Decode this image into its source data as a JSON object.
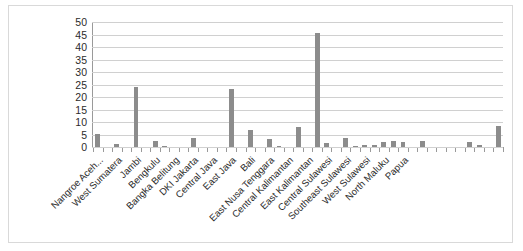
{
  "chart": {
    "title": "",
    "border_color": "#d9d9d9",
    "bar_color": "#8c8c8c",
    "gridline_color": "#d0d0d0",
    "axis_color": "#9a9a9a"
  },
  "chart_data": {
    "type": "bar",
    "title": "",
    "xlabel": "",
    "ylabel": "",
    "ylim": [
      0,
      50
    ],
    "yticks": [
      0,
      5,
      10,
      15,
      20,
      25,
      30,
      35,
      40,
      45,
      50
    ],
    "grid": true,
    "legend": false,
    "label_interval": 2,
    "categories": [
      "Nangroe Aceh...",
      "North Sumatera",
      "West Sumatera",
      "Riau",
      "Jambi",
      "South Sumatera",
      "Bengkulu",
      "Lampung",
      "Bangka Belitung",
      "Riau Islands",
      "DKI Jakarta",
      "West Java",
      "Central Java",
      "DI Yogyakarta",
      "East Java",
      "Banten",
      "Bali",
      "West Nusa Tenggara",
      "East Nusa Tenggara",
      "West Kalimantan",
      "Central Kalimantan",
      "South Kalimantan",
      "East Kalimantan",
      "North Sulawesi",
      "Central Sulawesi",
      "South Sulawesi",
      "Southeast Sulawesi",
      "Gorontalo",
      "West Sulawesi",
      "Maluku",
      "North Maluku",
      "West Papua",
      "Papua"
    ],
    "visible_tick_labels": [
      "Nangroe Aceh...",
      "West Sumatera",
      "Jambi",
      "Bengkulu",
      "Bangka Belitung",
      "DKI Jakarta",
      "Central Java",
      "East Java",
      "Bali",
      "East Nusa Tenggara",
      "Central Kalimantan",
      "East Kalimantan",
      "Central Sulawesi",
      "Southeast Sulawesi",
      "West Sulawesi",
      "North Maluku",
      "Papua"
    ],
    "values": [
      5.4,
      0,
      1.1,
      0,
      24.1,
      0,
      2.6,
      0.4,
      0,
      0,
      3.8,
      0,
      0,
      0,
      23.3,
      0,
      7.0,
      0,
      3.1,
      0.3,
      0,
      7.9,
      0,
      45.5,
      1.7,
      0,
      3.5,
      0.3,
      0.9,
      0.8,
      1.9,
      2.5,
      1.9
    ],
    "extra_values_right": [
      0,
      2.3,
      0,
      0,
      0,
      0,
      2.0,
      0.9,
      0,
      8.4
    ]
  }
}
